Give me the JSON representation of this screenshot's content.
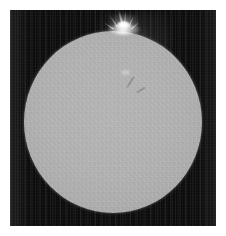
{
  "figure": {
    "kind": "astronomical-photograph",
    "width_px": 226,
    "height_px": 236,
    "margin_color": "#ffffff",
    "caption": "",
    "title": ""
  },
  "frame": {
    "name": "plate-frame",
    "x": 10,
    "y": 10,
    "width": 206,
    "height": 216,
    "sky_color": "#0c0c0c",
    "has_column_noise": true
  },
  "disk": {
    "name": "solar-disk",
    "center_x": 113,
    "center_y": 122,
    "radius_x": 89,
    "radius_y": 91,
    "surface_color": "#b2b2b2",
    "limb_color": "#8f8f8f",
    "limb_darkening": true
  },
  "features": [
    {
      "name": "limb-prominence",
      "type": "prominence",
      "position_angle_deg": 352,
      "center_x": 125,
      "center_y": 26,
      "peak_color": "#ffffff",
      "label": "bright eruptive prominence at upper limb"
    },
    {
      "name": "disk-filament",
      "type": "filament",
      "center_x": 130,
      "center_y": 82,
      "color": "#464646",
      "label": "faint dark filament north-east of disk centre"
    },
    {
      "name": "disk-plage",
      "type": "plage",
      "center_x": 125,
      "center_y": 72,
      "color": "#d2d2d2",
      "label": "faint bright plage region"
    }
  ],
  "colors": {
    "background": "#ffffff",
    "sky": "#0c0c0c",
    "photosphere": "#b2b2b2",
    "prominence": "#ffffff"
  }
}
